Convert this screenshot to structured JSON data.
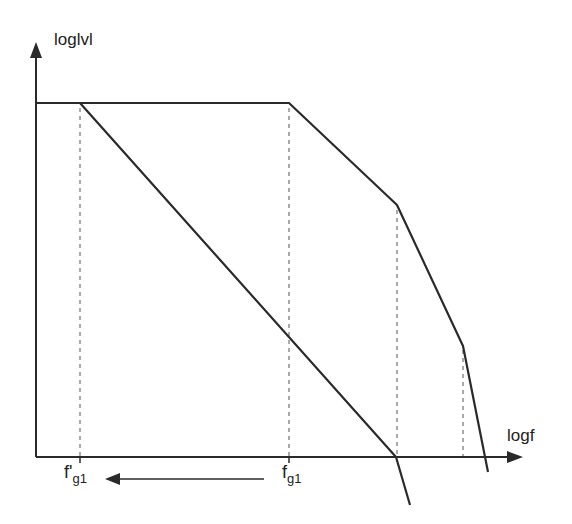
{
  "diagram": {
    "type": "bode-plot-asymptotic",
    "y_axis_label": "log|v|",
    "y_axis_display": "loglvl",
    "x_axis_label": "logf",
    "tick_labels": [
      {
        "main": "f'",
        "sub": "g1",
        "x": 80
      },
      {
        "main": "f",
        "sub": "g1",
        "x": 289
      }
    ],
    "arrow_annotation": {
      "from": "f_g1",
      "to": "f'_g1",
      "direction": "left"
    },
    "colors": {
      "line": "#2a2a2a",
      "dashed": "#555555",
      "background": "#ffffff"
    },
    "axes": {
      "origin": [
        36,
        457
      ],
      "y_top": 44,
      "x_right": 522
    },
    "curves": [
      {
        "name": "compensated-response",
        "points": [
          [
            36,
            103
          ],
          [
            80,
            103
          ],
          [
            396,
            457
          ],
          [
            410,
            505
          ]
        ]
      },
      {
        "name": "original-response",
        "points": [
          [
            36,
            103
          ],
          [
            289,
            103
          ],
          [
            397,
            205
          ],
          [
            463,
            346
          ],
          [
            488,
            472
          ]
        ]
      }
    ],
    "dashed_guides_x": [
      80,
      289,
      397,
      463
    ]
  }
}
